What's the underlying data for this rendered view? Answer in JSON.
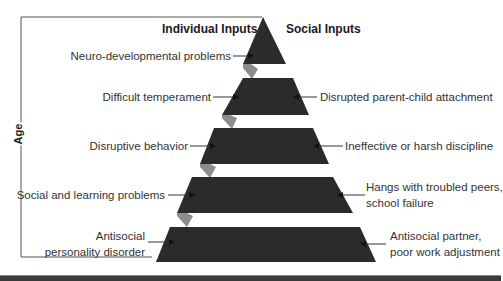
{
  "diagram": {
    "axis_label": "Age",
    "headers": {
      "left": "Individual Inputs",
      "right": "Social Inputs"
    },
    "tiers": [
      {
        "individual": "Neuro-developmental problems",
        "social": ""
      },
      {
        "individual": "Difficult temperament",
        "social": "Disrupted parent-child attachment"
      },
      {
        "individual": "Disruptive behavior",
        "social": "Ineffective or harsh discipline"
      },
      {
        "individual": "Social and learning problems",
        "social_line1": "Hangs with troubled peers,",
        "social_line2": "school failure"
      },
      {
        "individual_line1": "Antisocial",
        "individual_line2": "personality disorder",
        "social_line1": "Antisocial partner,",
        "social_line2": "poor work adjustment"
      }
    ],
    "colors": {
      "tier_fill": "#2b2b2b",
      "shadow_fill": "#8a8a8a",
      "line": "#444444",
      "bottom_bar": "#3a3a3a"
    }
  }
}
